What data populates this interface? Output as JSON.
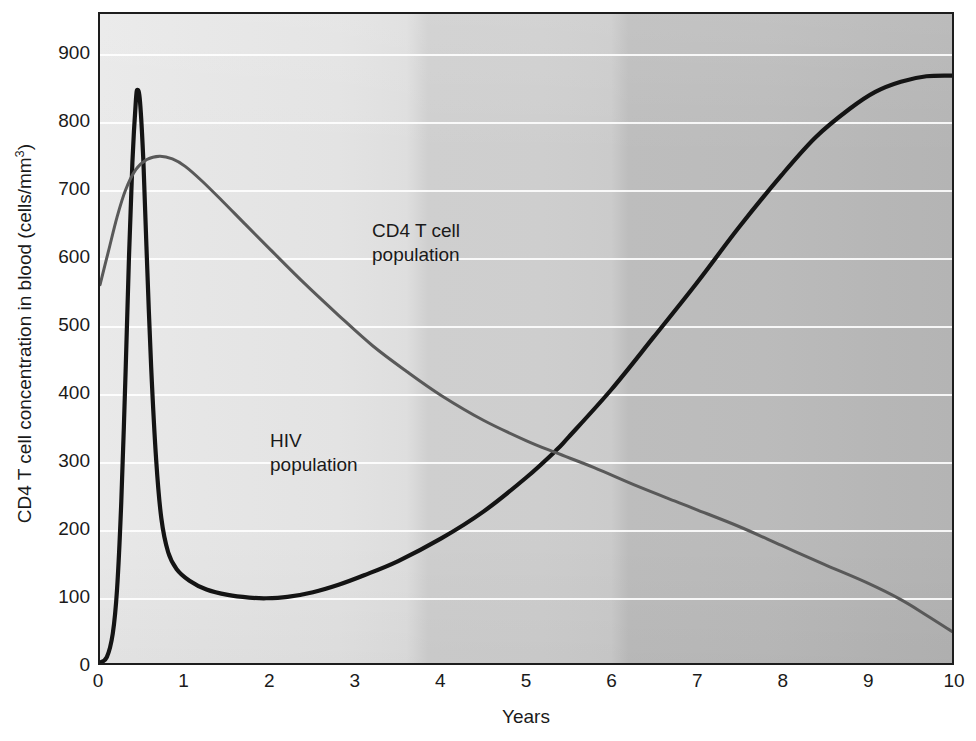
{
  "chart_data": {
    "type": "line",
    "title": "",
    "xlabel": "Years",
    "ylabel": "CD4 T cell concentration in blood (cells/mm",
    "ylabel_sup": "3",
    "ylabel_suffix": ")",
    "xlim": [
      0,
      10
    ],
    "ylim": [
      0,
      960
    ],
    "xticks": [
      0,
      1,
      2,
      3,
      4,
      5,
      6,
      7,
      8,
      9,
      10
    ],
    "xtick_labels": [
      "0",
      "1",
      "2",
      "3",
      "4",
      "5",
      "6",
      "7",
      "8",
      "9",
      "10"
    ],
    "yticks": [
      0,
      100,
      200,
      300,
      400,
      500,
      600,
      700,
      800,
      900
    ],
    "ytick_labels": [
      "0",
      "100",
      "200",
      "300",
      "400",
      "500",
      "600",
      "700",
      "800",
      "900"
    ],
    "grid": "horizontal",
    "grid_color": "#ffffff",
    "legend": "in-plot annotations",
    "background": "gray gradient, light at left darkening to the right",
    "series": [
      {
        "name": "HIV population",
        "color": "#141414",
        "width": 4.2,
        "annotation": "HIV\npopulation",
        "points": [
          [
            0.0,
            2
          ],
          [
            0.08,
            10
          ],
          [
            0.15,
            45
          ],
          [
            0.2,
            110
          ],
          [
            0.25,
            240
          ],
          [
            0.3,
            430
          ],
          [
            0.34,
            600
          ],
          [
            0.38,
            740
          ],
          [
            0.42,
            830
          ],
          [
            0.44,
            848
          ],
          [
            0.47,
            830
          ],
          [
            0.51,
            740
          ],
          [
            0.55,
            600
          ],
          [
            0.6,
            440
          ],
          [
            0.66,
            300
          ],
          [
            0.72,
            215
          ],
          [
            0.8,
            165
          ],
          [
            0.9,
            140
          ],
          [
            1.05,
            123
          ],
          [
            1.25,
            110
          ],
          [
            1.5,
            102
          ],
          [
            1.75,
            98
          ],
          [
            1.95,
            97
          ],
          [
            2.2,
            99
          ],
          [
            2.5,
            106
          ],
          [
            2.8,
            117
          ],
          [
            3.1,
            131
          ],
          [
            3.5,
            152
          ],
          [
            4.0,
            185
          ],
          [
            4.5,
            225
          ],
          [
            5.0,
            275
          ],
          [
            5.35,
            315
          ],
          [
            5.5,
            335
          ],
          [
            6.0,
            405
          ],
          [
            6.5,
            483
          ],
          [
            7.0,
            562
          ],
          [
            7.5,
            645
          ],
          [
            8.0,
            722
          ],
          [
            8.4,
            778
          ],
          [
            8.8,
            820
          ],
          [
            9.1,
            845
          ],
          [
            9.4,
            860
          ],
          [
            9.7,
            868
          ],
          [
            10.0,
            869
          ]
        ]
      },
      {
        "name": "CD4 T cell population",
        "color": "#595959",
        "width": 3.0,
        "annotation": "CD4 T cell\npopulation",
        "points": [
          [
            0.0,
            560
          ],
          [
            0.1,
            610
          ],
          [
            0.2,
            660
          ],
          [
            0.3,
            700
          ],
          [
            0.42,
            730
          ],
          [
            0.55,
            745
          ],
          [
            0.7,
            750
          ],
          [
            0.85,
            746
          ],
          [
            1.0,
            735
          ],
          [
            1.2,
            713
          ],
          [
            1.45,
            682
          ],
          [
            1.7,
            650
          ],
          [
            2.0,
            612
          ],
          [
            2.4,
            562
          ],
          [
            2.8,
            515
          ],
          [
            3.2,
            470
          ],
          [
            3.6,
            432
          ],
          [
            4.0,
            397
          ],
          [
            4.5,
            360
          ],
          [
            5.0,
            330
          ],
          [
            5.35,
            312
          ],
          [
            5.8,
            290
          ],
          [
            6.3,
            263
          ],
          [
            6.8,
            238
          ],
          [
            7.0,
            228
          ],
          [
            7.5,
            203
          ],
          [
            8.0,
            175
          ],
          [
            8.5,
            147
          ],
          [
            9.0,
            120
          ],
          [
            9.4,
            95
          ],
          [
            9.7,
            72
          ],
          [
            10.0,
            48
          ]
        ]
      }
    ]
  }
}
